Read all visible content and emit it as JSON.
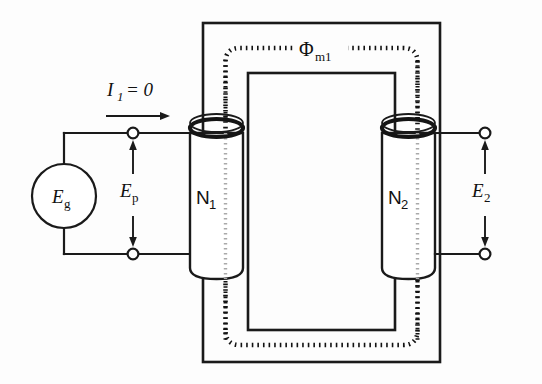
{
  "figure": {
    "background_color": "#fdfdfd",
    "line_color": "#1a1a1a"
  },
  "labels": {
    "source": {
      "symbol": "E",
      "subscript": "g",
      "name": "generator-emf"
    },
    "primary_voltage": {
      "symbol": "E",
      "subscript": "p",
      "name": "primary-voltage"
    },
    "secondary_voltage": {
      "symbol": "E",
      "subscript": "2",
      "name": "secondary-voltage"
    },
    "primary_current": {
      "symbol": "I",
      "subscript": "1",
      "equals": "= 0",
      "name": "primary-current"
    },
    "primary_turns": {
      "symbol": "N",
      "subscript": "1",
      "name": "primary-turns"
    },
    "secondary_turns": {
      "symbol": "N",
      "subscript": "2",
      "name": "secondary-turns"
    },
    "mutual_flux": {
      "symbol": "Φ",
      "subscript": "m1",
      "name": "mutual-flux"
    }
  },
  "components": {
    "source_name": "ac-voltage-source",
    "core_name": "iron-core",
    "primary_coil_name": "primary-coil",
    "secondary_coil_name": "secondary-coil",
    "flux_name": "flux-loop",
    "input_terminals": "input-terminals",
    "output_terminals": "output-terminals"
  }
}
